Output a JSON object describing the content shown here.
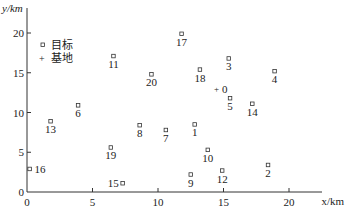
{
  "chart_data": {
    "type": "scatter",
    "title": "",
    "xlabel": "x/km",
    "ylabel": "y/km",
    "xlim": [
      0,
      22
    ],
    "ylim": [
      0,
      23
    ],
    "xticks": [
      0,
      5,
      10,
      15,
      20
    ],
    "yticks": [
      0,
      5,
      10,
      15,
      20
    ],
    "grid": false,
    "legend": {
      "position": "upper-left",
      "entries": [
        {
          "marker": "square",
          "label": "目标"
        },
        {
          "marker": "plus",
          "label": "基地"
        }
      ]
    },
    "series": [
      {
        "name": "目标",
        "marker": "square",
        "points": [
          {
            "label": "1",
            "x": 12.8,
            "y": 8.5
          },
          {
            "label": "2",
            "x": 18.4,
            "y": 3.4
          },
          {
            "label": "3",
            "x": 15.4,
            "y": 16.8
          },
          {
            "label": "4",
            "x": 18.9,
            "y": 15.2
          },
          {
            "label": "5",
            "x": 15.5,
            "y": 11.8
          },
          {
            "label": "6",
            "x": 3.9,
            "y": 10.9
          },
          {
            "label": "7",
            "x": 10.6,
            "y": 7.8
          },
          {
            "label": "8",
            "x": 8.6,
            "y": 8.4
          },
          {
            "label": "9",
            "x": 12.5,
            "y": 2.2
          },
          {
            "label": "10",
            "x": 13.8,
            "y": 5.3
          },
          {
            "label": "11",
            "x": 6.6,
            "y": 17.1
          },
          {
            "label": "12",
            "x": 14.9,
            "y": 2.7
          },
          {
            "label": "13",
            "x": 1.8,
            "y": 8.9
          },
          {
            "label": "14",
            "x": 17.2,
            "y": 11.1
          },
          {
            "label": "15",
            "x": 7.3,
            "y": 1.1
          },
          {
            "label": "16",
            "x": 0.2,
            "y": 2.9
          },
          {
            "label": "17",
            "x": 11.8,
            "y": 19.9
          },
          {
            "label": "18",
            "x": 13.2,
            "y": 15.4
          },
          {
            "label": "19",
            "x": 6.4,
            "y": 5.6
          },
          {
            "label": "20",
            "x": 9.5,
            "y": 14.8
          }
        ]
      },
      {
        "name": "基地",
        "marker": "plus",
        "points": [
          {
            "label": "0",
            "x": 14.5,
            "y": 13.0
          }
        ]
      }
    ]
  }
}
